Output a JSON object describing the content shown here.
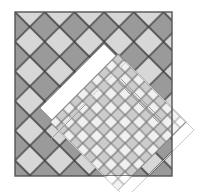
{
  "figure": {
    "title": "Argyle diamond lattice with rotated fine-grid overlay",
    "canvas": {
      "width": 208,
      "height": 192,
      "background": "#ffffff"
    },
    "colors": {
      "background": "#ffffff",
      "light_diamond": "#d7d7d7",
      "dark_diamond": "#9a9a9a",
      "mid_diamond": "#b5b5b5",
      "white_band": "#ffffff",
      "lattice_line": "#3a3a3a",
      "border": "#555555",
      "fine_line": "#6e6e6e",
      "fine_light": "#e2e2e2",
      "fine_mid": "#c9c9c9",
      "overlay_outline": "#888888",
      "faint_outline": "#bcbcbc"
    },
    "main_square": {
      "label": "outer bordered square",
      "x": 15,
      "y": 12,
      "width": 157,
      "height": 164,
      "stroke": "#555555",
      "stroke_width": 1.4,
      "fill": "#e9e9e9"
    },
    "coarse_lattice": {
      "label": "argyle diamond lattice",
      "diamond_half_diagonal": 21,
      "rotation_deg": 45,
      "line_color": "#3a3a3a",
      "line_width": 1.3,
      "fill_sequence": [
        "#9a9a9a",
        "#d7d7d7"
      ]
    },
    "white_band": {
      "label": "white diagonal L-shaped band",
      "fill": "#ffffff",
      "points": "104,44 130,70 92,108 104,120 78,146 40,108"
    },
    "accent_diamond": {
      "label": "single mid-gray diamond inside band",
      "fill": "#9a9a9a",
      "points": "110,76 131,97 110,118 89,97"
    },
    "rotated_overlay": {
      "label": "rotated square with fine diamond lattice",
      "center_x": 118,
      "center_y": 122,
      "half_diagonal": 68,
      "rotation_deg": 45,
      "fine_cell": 10,
      "outline_color": "#888888",
      "outline_width": 1.1
    },
    "faint_outline": {
      "label": "faint offset rotated square outline",
      "points": "126,62 194,130 126,198 58,130",
      "stroke": "#c9c9c9",
      "stroke_width": 1.0
    },
    "streak_lines": {
      "label": "diagonal streak highlight lines",
      "color": "#9a9a9a",
      "count": 4
    }
  }
}
